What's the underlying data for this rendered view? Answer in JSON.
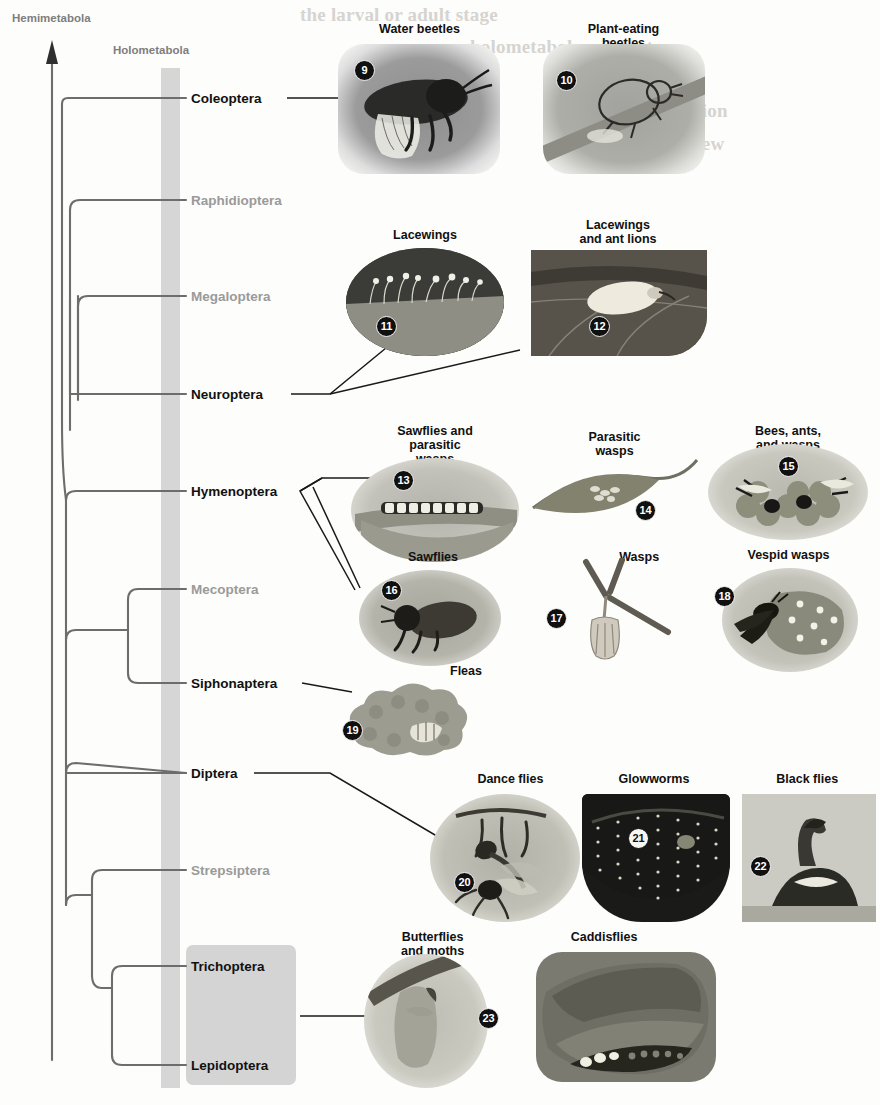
{
  "figure": {
    "type": "cladogram-with-photos",
    "axis_label_left": "Hemimetabola",
    "axis_label_group": "Holometabola"
  },
  "cladogram": {
    "taxa": [
      {
        "name": "Coleoptera",
        "bold": true,
        "y": 98
      },
      {
        "name": "Raphidioptera",
        "bold": false,
        "y": 200
      },
      {
        "name": "Megaloptera",
        "bold": false,
        "y": 296
      },
      {
        "name": "Neuroptera",
        "bold": true,
        "y": 394
      },
      {
        "name": "Hymenoptera",
        "bold": true,
        "y": 491
      },
      {
        "name": "Mecoptera",
        "bold": false,
        "y": 589
      },
      {
        "name": "Siphonaptera",
        "bold": true,
        "y": 683
      },
      {
        "name": "Diptera",
        "bold": true,
        "y": 773
      },
      {
        "name": "Strepsiptera",
        "bold": false,
        "y": 870
      },
      {
        "name": "Trichoptera",
        "bold": true,
        "y": 966
      },
      {
        "name": "Lepidoptera",
        "bold": true,
        "y": 1065
      }
    ]
  },
  "panels": [
    {
      "id": "p9",
      "caption": "Water beetles",
      "number": "9"
    },
    {
      "id": "p10",
      "caption": "Plant-eating beetles",
      "number": "10"
    },
    {
      "id": "p11",
      "caption": "Lacewings",
      "number": "11"
    },
    {
      "id": "p12",
      "caption": "Lacewings\nand ant lions",
      "number": "12"
    },
    {
      "id": "p13",
      "caption": "Sawflies and\nparasitic wasps",
      "number": "13"
    },
    {
      "id": "p14",
      "caption": "Parasitic wasps",
      "number": "14"
    },
    {
      "id": "p15",
      "caption": "Bees, ants, and wasps",
      "number": "15"
    },
    {
      "id": "p16",
      "caption": "Sawflies",
      "number": "16"
    },
    {
      "id": "p17",
      "caption": "Wasps",
      "number": "17"
    },
    {
      "id": "p18",
      "caption": "Vespid wasps",
      "number": "18"
    },
    {
      "id": "p19",
      "caption": "Fleas",
      "number": "19"
    },
    {
      "id": "p20",
      "caption": "Dance flies",
      "number": "20"
    },
    {
      "id": "p21",
      "caption": "Glowworms",
      "number": "21"
    },
    {
      "id": "p22",
      "caption": "Black flies",
      "number": "22"
    },
    {
      "id": "p23a",
      "caption": "Butterflies and moths",
      "number": ""
    },
    {
      "id": "p23b",
      "caption": "Caddisflies",
      "number": "23"
    }
  ],
  "background_text": {
    "lines": [
      "the larval or adult stage",
      "holometabolous insects",
      "of the variation",
      "only a few"
    ]
  },
  "colors": {
    "band": "#cfcfcf",
    "branch": "#6d6d6d",
    "bold_taxon": "#111111",
    "muted_taxon": "#9a9a9a",
    "page": "#fdfdfb"
  }
}
